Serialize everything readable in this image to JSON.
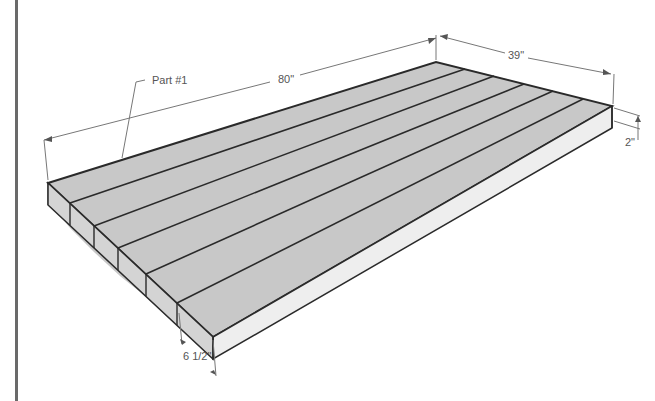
{
  "diagram": {
    "type": "isometric tabletop assembly drawing",
    "part_label": "Part #1",
    "dimensions": {
      "length": "80\"",
      "width": "39\"",
      "thickness": "2\"",
      "board_width": "6 1/2\""
    },
    "board_count": 6,
    "colors": {
      "top_face": "#c8c8c8",
      "front_end_face": "#d4d4d4",
      "side_face": "#ededed",
      "edge_line": "#2a2a2a",
      "dimension_line": "#777777",
      "border": "#6a6a6a"
    }
  }
}
